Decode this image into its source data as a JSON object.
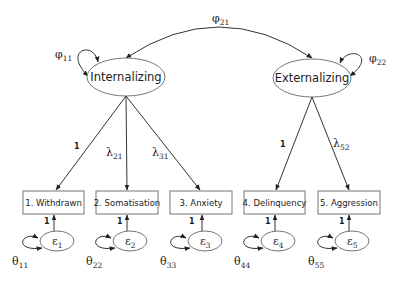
{
  "diagram": {
    "type": "structural-equation-model",
    "latent_factors": [
      {
        "id": "F1",
        "label": "Internalizing",
        "variance": {
          "symbol": "φ",
          "sub": "11"
        }
      },
      {
        "id": "F2",
        "label": "Externalizing",
        "variance": {
          "symbol": "φ",
          "sub": "22"
        }
      }
    ],
    "covariance": {
      "from": "F1",
      "to": "F2",
      "symbol": "φ",
      "sub": "21"
    },
    "indicators": [
      {
        "label": "1. Withdrawn",
        "factor": "F1",
        "loading": "1",
        "error": {
          "symbol": "ε",
          "sub": "1"
        },
        "error_variance": {
          "symbol": "θ",
          "sub": "11"
        },
        "error_path": "1"
      },
      {
        "label": "2. Somatisation",
        "factor": "F1",
        "loading": {
          "symbol": "λ",
          "sub": "21"
        },
        "error": {
          "symbol": "ε",
          "sub": "2"
        },
        "error_variance": {
          "symbol": "θ",
          "sub": "22"
        },
        "error_path": "1"
      },
      {
        "label": "3. Anxiety",
        "factor": "F1",
        "loading": {
          "symbol": "λ",
          "sub": "31"
        },
        "error": {
          "symbol": "ε",
          "sub": "3"
        },
        "error_variance": {
          "symbol": "θ",
          "sub": "33"
        },
        "error_path": "1"
      },
      {
        "label": "4. Delinquency",
        "factor": "F2",
        "loading": "1",
        "error": {
          "symbol": "ε",
          "sub": "4"
        },
        "error_variance": {
          "symbol": "θ",
          "sub": "44"
        },
        "error_path": "1"
      },
      {
        "label": "5. Aggression",
        "factor": "F2",
        "loading": {
          "symbol": "λ",
          "sub": "52"
        },
        "error": {
          "symbol": "ε",
          "sub": "5"
        },
        "error_variance": {
          "symbol": "θ",
          "sub": "55"
        },
        "error_path": "1"
      }
    ]
  }
}
